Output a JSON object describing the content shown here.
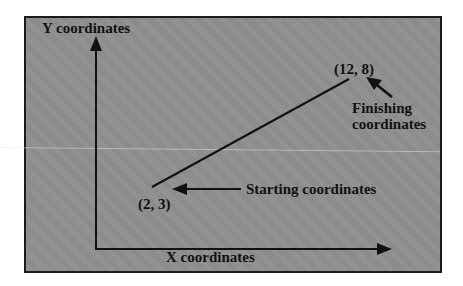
{
  "diagram": {
    "type": "coordinate-line-diagram",
    "axes": {
      "y_label": "Y coordinates",
      "x_label": "X coordinates"
    },
    "points": {
      "start": {
        "label": "(2, 3)",
        "x": 2,
        "y": 3,
        "annotation": "Starting coordinates"
      },
      "end": {
        "label": "(12, 8)",
        "x": 12,
        "y": 8,
        "annotation_line1": "Finishing",
        "annotation_line2": "coordinates"
      }
    },
    "colors": {
      "panel_background": "#8f8f8f",
      "ink": "#111111",
      "page_background": "#ffffff"
    }
  }
}
